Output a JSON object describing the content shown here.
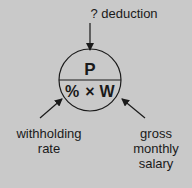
{
  "diagram": {
    "type": "formula-circle",
    "top_input": {
      "label": "? deduction",
      "direction": "into-top"
    },
    "circle": {
      "top": "P",
      "bottom": {
        "left": "%",
        "operator": "×",
        "right": "W"
      }
    },
    "left_input": {
      "line1": "withholding",
      "line2": "rate"
    },
    "right_input": {
      "line1": "gross",
      "line2": "monthly",
      "line3": "salary"
    }
  }
}
